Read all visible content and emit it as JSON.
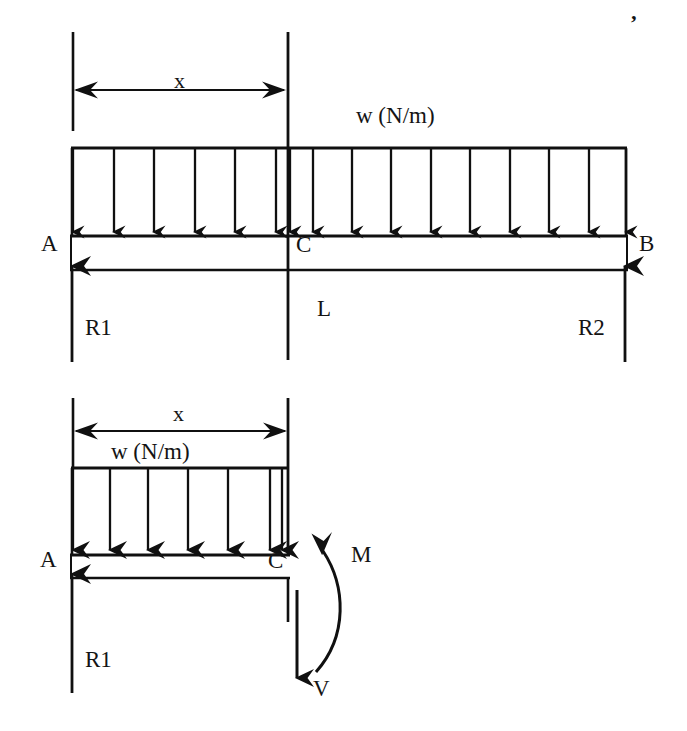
{
  "figure": {
    "type": "engineering-free-body-diagram",
    "stroke_color": "#101010",
    "background_color": "#ffffff",
    "width": 687,
    "height": 731
  },
  "top_diagram": {
    "name": "full-beam-free-body-diagram",
    "dimension_x_label": "x",
    "load_label": "w (N/m)",
    "support_a_label": "A",
    "section_c_label": "C",
    "support_b_label": "B",
    "span_label": "L",
    "reaction_left_label": "R1",
    "reaction_right_label": "R2",
    "geometry": {
      "beam_left_x": 72,
      "beam_right_x": 626,
      "beam_top_y": 236,
      "beam_bottom_y": 270,
      "load_bar_y": 148,
      "section_c_x": 288,
      "dimension_line_y": 90,
      "extension_line_top_y": 32,
      "extension_line_bottom_y": 130,
      "center_line_bottom_y": 360,
      "load_arrow_count": 16,
      "load_arrow_spacing": 38
    }
  },
  "bottom_diagram": {
    "name": "cut-segment-free-body-diagram",
    "dimension_x_label": "x",
    "load_label": "w (N/m)",
    "support_a_label": "A",
    "section_c_label": "C",
    "reaction_left_label": "R1",
    "moment_label": "M",
    "shear_label": "V",
    "geometry": {
      "segment_left_x": 72,
      "segment_right_x": 288,
      "beam_top_y": 555,
      "beam_bottom_y": 578,
      "load_bar_y": 468,
      "dimension_line_y": 431,
      "extension_line_top_y": 398,
      "extension_line_bottom_y": 468,
      "cut_line_top_y": 398,
      "cut_line_bottom_y": 620,
      "load_arrow_count": 7,
      "shear_arrow_x": 297,
      "shear_arrow_tip_y": 693,
      "moment_arrow_tip_x": 313,
      "moment_arrow_tip_y": 543
    }
  },
  "marks": {
    "stray_apostrophe": "’"
  }
}
